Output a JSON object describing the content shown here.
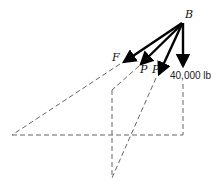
{
  "diagram": {
    "type": "force-vector-diagram",
    "point": {
      "label": "B"
    },
    "forces": [
      {
        "id": "F",
        "label": "F"
      },
      {
        "id": "P1",
        "label": "P"
      },
      {
        "id": "P2",
        "label": "P"
      },
      {
        "id": "W",
        "label": "40,000 lb"
      }
    ],
    "colors": {
      "force": "#000000",
      "construction": "#555555",
      "background": "#ffffff"
    }
  }
}
